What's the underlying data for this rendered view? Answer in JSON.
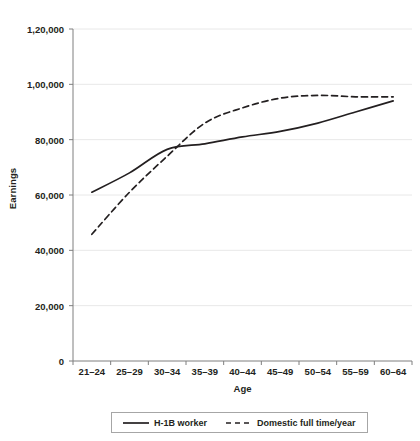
{
  "chart_data": {
    "type": "line",
    "title": "",
    "xlabel": "Age",
    "ylabel": "Earnings",
    "categories": [
      "21–24",
      "25–29",
      "30–34",
      "35–39",
      "40–44",
      "45–49",
      "50–54",
      "55–59",
      "60–64"
    ],
    "ylim": [
      0,
      120000
    ],
    "ytick_values": [
      0,
      20000,
      40000,
      60000,
      80000,
      100000,
      120000
    ],
    "ytick_labels": [
      "0",
      "20,000",
      "40,000",
      "60,000",
      "80,000",
      "1,00,000",
      "1,20,000"
    ],
    "grid": "horizontal",
    "legend_position": "bottom",
    "series": [
      {
        "name": "H-1B worker",
        "style": "solid",
        "color": "#231f20",
        "values": [
          61000,
          68000,
          76500,
          78500,
          81000,
          83000,
          86000,
          90000,
          94000
        ]
      },
      {
        "name": "Domestic full time/year",
        "style": "dashed",
        "color": "#231f20",
        "values": [
          45800,
          61000,
          74000,
          86000,
          91500,
          95000,
          96000,
          95500,
          95500
        ]
      }
    ]
  },
  "axes": {
    "y_title": "Earnings",
    "x_title": "Age"
  },
  "legend": {
    "items": [
      {
        "label": "H-1B worker",
        "style": "solid"
      },
      {
        "label": "Domestic full time/year",
        "style": "dashed"
      }
    ]
  }
}
